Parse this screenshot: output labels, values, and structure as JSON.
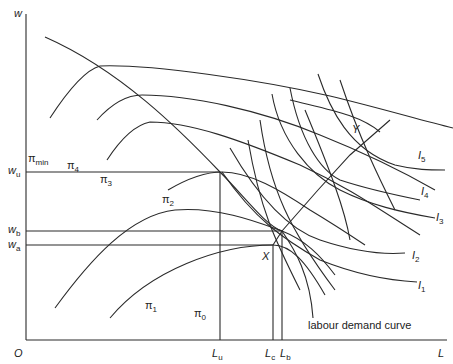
{
  "diagram": {
    "type": "economics-diagram",
    "axes": {
      "y_label": "w",
      "x_label": "L",
      "origin_label": "O"
    },
    "wage_levels": [
      {
        "id": "wu",
        "base": "w",
        "sub": "u"
      },
      {
        "id": "wb",
        "base": "w",
        "sub": "b"
      },
      {
        "id": "wa",
        "base": "w",
        "sub": "a"
      }
    ],
    "employment_levels": [
      {
        "id": "Lu",
        "base": "L",
        "sub": "u"
      },
      {
        "id": "Lc",
        "base": "L",
        "sub": "c"
      },
      {
        "id": "Lb",
        "base": "L",
        "sub": "b"
      }
    ],
    "isoprofit_curves": [
      {
        "id": "pi_min",
        "base": "π",
        "sub": "min"
      },
      {
        "id": "pi4",
        "base": "π",
        "sub": "4"
      },
      {
        "id": "pi3",
        "base": "π",
        "sub": "3"
      },
      {
        "id": "pi2",
        "base": "π",
        "sub": "2"
      },
      {
        "id": "pi1",
        "base": "π",
        "sub": "1"
      },
      {
        "id": "pi0",
        "base": "π",
        "sub": "0"
      }
    ],
    "indifference_curves": [
      {
        "id": "I5",
        "base": "I",
        "sub": "5"
      },
      {
        "id": "I4",
        "base": "I",
        "sub": "4"
      },
      {
        "id": "I3",
        "base": "I",
        "sub": "3"
      },
      {
        "id": "I2",
        "base": "I",
        "sub": "2"
      },
      {
        "id": "I1",
        "base": "I",
        "sub": "1"
      }
    ],
    "points": [
      {
        "id": "X",
        "label": "X"
      },
      {
        "id": "Y",
        "label": "Y"
      }
    ],
    "annotations": {
      "labour_demand": "labour demand curve"
    },
    "colors": {
      "line": "#2a2a2a",
      "background": "#ffffff"
    }
  }
}
